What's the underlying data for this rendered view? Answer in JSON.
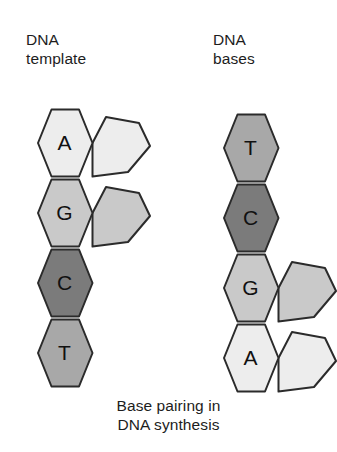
{
  "figure": {
    "caption": "Base pairing in\nDNA synthesis"
  },
  "columns": {
    "left": {
      "heading": "DNA\ntemplate"
    },
    "right": {
      "heading": "DNA\nbases"
    }
  },
  "palette": {
    "adenine": "#ededed",
    "guanine": "#c9c9c9",
    "thymine": "#a8a8a8",
    "cytosine": "#7b7b7b",
    "outline": "#2b2b2b",
    "background": "#ffffff",
    "text": "#1d1d1d"
  },
  "bases": {
    "left_column": [
      {
        "letter": "A",
        "name": "adenine",
        "shape": "purine",
        "fill": "#ededed",
        "x": 36,
        "y": 106
      },
      {
        "letter": "G",
        "name": "guanine",
        "shape": "purine",
        "fill": "#c9c9c9",
        "x": 36,
        "y": 176
      },
      {
        "letter": "C",
        "name": "cytosine",
        "shape": "pyrimidine",
        "fill": "#7b7b7b",
        "x": 36,
        "y": 246
      },
      {
        "letter": "T",
        "name": "thymine",
        "shape": "pyrimidine",
        "fill": "#a8a8a8",
        "x": 36,
        "y": 316
      }
    ],
    "right_column": [
      {
        "letter": "T",
        "name": "thymine",
        "shape": "pyrimidine",
        "fill": "#a8a8a8",
        "x": 222,
        "y": 111
      },
      {
        "letter": "C",
        "name": "cytosine",
        "shape": "pyrimidine",
        "fill": "#7b7b7b",
        "x": 222,
        "y": 181
      },
      {
        "letter": "G",
        "name": "guanine",
        "shape": "purine",
        "fill": "#c9c9c9",
        "x": 222,
        "y": 251
      },
      {
        "letter": "A",
        "name": "adenine",
        "shape": "purine",
        "fill": "#ededed",
        "x": 222,
        "y": 321
      }
    ]
  },
  "pairs": [
    {
      "template": "A",
      "incoming": "T"
    },
    {
      "template": "G",
      "incoming": "C"
    },
    {
      "template": "C",
      "incoming": "G"
    },
    {
      "template": "T",
      "incoming": "A"
    }
  ]
}
